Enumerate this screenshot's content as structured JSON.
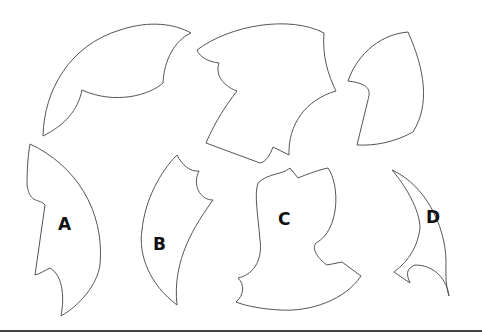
{
  "diagram": {
    "unlabeled_pieces": [
      "piece-top-left",
      "piece-top-center",
      "piece-top-right"
    ],
    "options": [
      {
        "id": "A",
        "label": "A"
      },
      {
        "id": "B",
        "label": "B"
      },
      {
        "id": "C",
        "label": "C"
      },
      {
        "id": "D",
        "label": "D"
      }
    ],
    "colors": {
      "stroke": "#555555",
      "fill": "#ffffff",
      "text": "#111111",
      "rule": "#444444"
    }
  }
}
